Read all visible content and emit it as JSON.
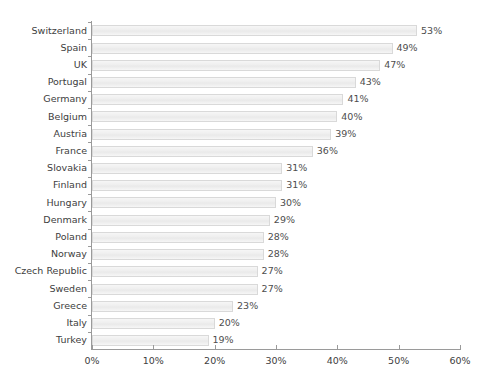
{
  "chart_data": {
    "type": "bar",
    "orientation": "horizontal",
    "title": "",
    "subtitle": "",
    "xlabel": "",
    "ylabel": "",
    "xlim": [
      0,
      60
    ],
    "grid": false,
    "legend": null,
    "value_suffix": "%",
    "xticks": [
      {
        "value": 0,
        "label": "0%"
      },
      {
        "value": 10,
        "label": "10%"
      },
      {
        "value": 20,
        "label": "20%"
      },
      {
        "value": 30,
        "label": "30%"
      },
      {
        "value": 40,
        "label": "40%"
      },
      {
        "value": 50,
        "label": "50%"
      },
      {
        "value": 60,
        "label": "60%"
      }
    ],
    "categories": [
      "Switzerland",
      "Spain",
      "UK",
      "Portugal",
      "Germany",
      "Belgium",
      "Austria",
      "France",
      "Slovakia",
      "Finland",
      "Hungary",
      "Denmark",
      "Poland",
      "Norway",
      "Czech Republic",
      "Sweden",
      "Greece",
      "Italy",
      "Turkey"
    ],
    "values": [
      53,
      49,
      47,
      43,
      41,
      40,
      39,
      36,
      31,
      31,
      30,
      29,
      28,
      28,
      27,
      27,
      23,
      20,
      19
    ],
    "data_labels": [
      "53%",
      "49%",
      "47%",
      "43%",
      "41%",
      "40%",
      "39%",
      "36%",
      "31%",
      "31%",
      "30%",
      "29%",
      "28%",
      "28%",
      "27%",
      "27%",
      "23%",
      "20%",
      "19%"
    ],
    "colors": {
      "bar_fill": "#f1f1f1",
      "bar_border": "#d9d9d9",
      "axis": "#9a9a9a",
      "label_text": "#404040",
      "value_text": "#4d4d4d",
      "background": "#ffffff"
    }
  }
}
